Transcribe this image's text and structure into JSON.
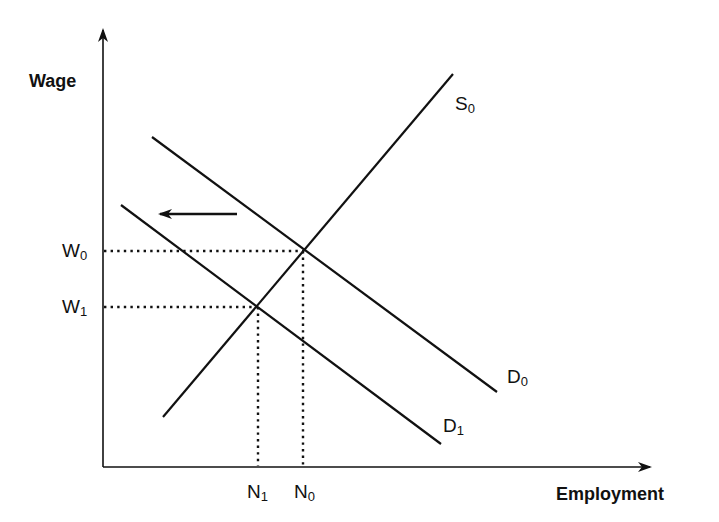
{
  "diagram": {
    "type": "labor-market supply-demand",
    "y_axis": {
      "label": "Wage"
    },
    "x_axis": {
      "label": "Employment"
    },
    "wages": [
      {
        "id": "W0",
        "base": "W",
        "sub": "0"
      },
      {
        "id": "W1",
        "base": "W",
        "sub": "1"
      }
    ],
    "employment": [
      {
        "id": "N1",
        "base": "N",
        "sub": "1"
      },
      {
        "id": "N0",
        "base": "N",
        "sub": "0"
      }
    ],
    "curves": [
      {
        "id": "S0",
        "base": "S",
        "sub": "0",
        "kind": "supply"
      },
      {
        "id": "D0",
        "base": "D",
        "sub": "0",
        "kind": "demand"
      },
      {
        "id": "D1",
        "base": "D",
        "sub": "1",
        "kind": "demand"
      }
    ],
    "shift_arrow": {
      "direction": "left",
      "meaning": "demand shifts from D0 to D1"
    },
    "colors": {
      "ink": "#111111",
      "background": "#ffffff"
    }
  }
}
